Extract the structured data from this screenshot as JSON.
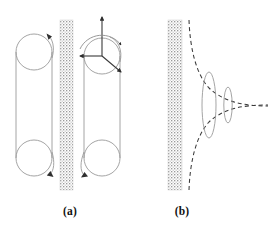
{
  "figure": {
    "kind": "scientific-line-diagram",
    "background_color": "#ffffff",
    "line_color": "#8c8c8c",
    "dark_line_color": "#3a3a3a",
    "wall_color": "#b9b9b9",
    "caption_color": "#111111",
    "width": 273,
    "height": 234
  },
  "captions": {
    "panel_a": "(a)",
    "panel_b": "(b)"
  },
  "panel_a": {
    "label": "(a)",
    "wall": {
      "name": "stippled-wall",
      "x": 60,
      "y": 20,
      "width": 13,
      "height": 170,
      "fill": "#b9b9b9"
    },
    "left_loop": {
      "name": "dislocation-loop-left",
      "top_circle": {
        "cx": 34,
        "cy": 52,
        "r": 18
      },
      "bottom_circle": {
        "cx": 34,
        "cy": 158,
        "r": 18
      },
      "left_line_x": 16,
      "right_line_x": 52,
      "arrowheads": [
        {
          "x": 51,
          "y": 38,
          "dir": "down-left"
        },
        {
          "x": 51,
          "y": 172,
          "dir": "down-right"
        }
      ]
    },
    "right_loop": {
      "name": "dislocation-loop-right",
      "top_circle": {
        "cx": 102,
        "cy": 56,
        "r": 18
      },
      "bottom_circle": {
        "cx": 102,
        "cy": 158,
        "r": 18
      },
      "left_line_x": 84,
      "right_line_x": 120,
      "arrowheads": [
        {
          "x": 85,
          "y": 172,
          "dir": "down-left"
        }
      ]
    },
    "axes": {
      "name": "burgers-vector-triad",
      "origin": {
        "x": 102,
        "y": 56
      },
      "vectors": [
        {
          "name": "axis-vertical-up",
          "dx": 0,
          "dy": -41
        },
        {
          "name": "axis-horizontal-left",
          "dx": -22,
          "dy": 0
        },
        {
          "name": "axis-diagonal-down-right",
          "dx": 19,
          "dy": 16
        }
      ],
      "arc": {
        "name": "rotation-arc-arrow",
        "cx": 102,
        "cy": 56,
        "r": 22,
        "start_deg": 185,
        "end_deg": 330
      }
    }
  },
  "panel_b": {
    "label": "(b)",
    "wall": {
      "name": "stippled-wall",
      "x": 168,
      "y": 20,
      "width": 14,
      "height": 170,
      "fill": "#b9b9b9"
    },
    "dashed_curves": [
      {
        "name": "upper-hyperbola",
        "description": "dashed curve descending from top-left near wall to right asymptote"
      },
      {
        "name": "lower-hyperbola",
        "description": "dashed curve ascending from bottom-left near wall to right asymptote"
      }
    ],
    "ellipses": [
      {
        "name": "pileup-loop-outer",
        "cx": 209,
        "cy": 105,
        "rx": 7,
        "ry": 33
      },
      {
        "name": "pileup-loop-inner",
        "cx": 228,
        "cy": 105,
        "rx": 4,
        "ry": 18
      }
    ],
    "dash_pattern": "4 3",
    "cusp_apex": {
      "x": 262,
      "y": 105
    }
  }
}
